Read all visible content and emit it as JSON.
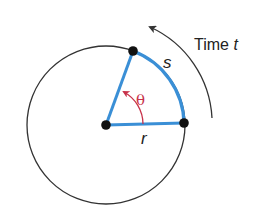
{
  "diagram": {
    "labels": {
      "arc": "s",
      "radius": "r",
      "angle": "θ",
      "time_prefix": "Time ",
      "time_var": "t"
    },
    "colors": {
      "circle": "#333333",
      "sector": "#3a8fd6",
      "angle": "#c8324a",
      "points": "#111111",
      "arrow": "#333333",
      "text": "#222222"
    },
    "geometry": {
      "center": [
        106,
        125
      ],
      "radius": 79,
      "points": [
        {
          "name": "center",
          "x": 106,
          "y": 125
        },
        {
          "name": "radius-end",
          "x": 184,
          "y": 123
        },
        {
          "name": "arc-end",
          "x": 133,
          "y": 51
        }
      ]
    }
  }
}
